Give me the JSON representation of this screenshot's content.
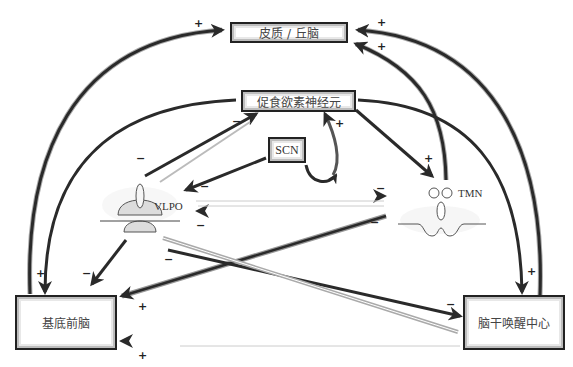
{
  "nodes": {
    "cortex": {
      "label": "皮质 / 丘脑"
    },
    "orexin": {
      "label": "促食欲素神经元"
    },
    "scn": {
      "label": "SCN"
    },
    "vlpo": {
      "label": "VLPO"
    },
    "tmn": {
      "label": "TMN"
    },
    "basal_forebrain": {
      "label": "基底前脑"
    },
    "brainstem": {
      "label": "脑干唤醒中心"
    }
  },
  "signs": {
    "plus": "+",
    "minus": "−"
  },
  "colors": {
    "arrow": "#2a2a2a",
    "arrow_light": "#9a9a9a",
    "box_border": "#222222",
    "anatomy_fill": "#dcdcdc",
    "anatomy_stroke": "#555555"
  },
  "connections": [
    {
      "from": "基底前脑",
      "to": "皮质 / 丘脑",
      "sign": "+"
    },
    {
      "from": "脑干唤醒中心",
      "to": "皮质 / 丘脑",
      "sign": "+"
    },
    {
      "from": "TMN",
      "to": "皮质 / 丘脑",
      "sign": "+"
    },
    {
      "from": "促食欲素神经元",
      "to": "基底前脑",
      "sign": "+"
    },
    {
      "from": "促食欲素神经元",
      "to": "TMN",
      "sign": "+"
    },
    {
      "from": "促食欲素神经元",
      "to": "脑干唤醒中心",
      "sign": "+"
    },
    {
      "from": "VLPO",
      "to": "促食欲素神经元",
      "sign": "−"
    },
    {
      "from": "SCN",
      "to": "VLPO",
      "sign": "−"
    },
    {
      "from": "SCN",
      "to": "促食欲素神经元",
      "sign": "+"
    },
    {
      "from": "VLPO",
      "to": "TMN",
      "sign": "−"
    },
    {
      "from": "TMN",
      "to": "VLPO",
      "sign": "−"
    },
    {
      "from": "VLPO",
      "to": "基底前脑",
      "sign": "−"
    },
    {
      "from": "VLPO",
      "to": "脑干唤醒中心",
      "sign": "−"
    },
    {
      "from": "脑干唤醒中心",
      "to": "VLPO",
      "sign": "−"
    },
    {
      "from": "TMN",
      "to": "基底前脑",
      "sign": "+"
    },
    {
      "from": "脑干唤醒中心",
      "to": "基底前脑",
      "sign": "+"
    }
  ]
}
